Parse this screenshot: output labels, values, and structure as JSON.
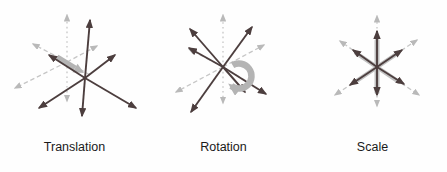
{
  "figure": {
    "background": "#fefefe",
    "panels": [
      {
        "id": "translation",
        "label": "Translation",
        "icons": [
          "original-axes-star",
          "transformed-axes-star",
          "translation-arrow"
        ]
      },
      {
        "id": "rotation",
        "label": "Rotation",
        "icons": [
          "original-axes-star",
          "transformed-axes-star",
          "rotation-curved-arrow"
        ]
      },
      {
        "id": "scale",
        "label": "Scale",
        "icons": [
          "original-axes-star",
          "transformed-axes-star",
          "scale-underlay-star"
        ]
      }
    ],
    "colors": {
      "transformed_axes": "#4c3e3e",
      "original_axes": "#c6c6c6",
      "original_axes_head": "#b9b9b9",
      "highlight_arrow": "#b4b4b4",
      "scale_underlay": "#c0c0c0",
      "label_text": "#1a1a1a"
    }
  }
}
